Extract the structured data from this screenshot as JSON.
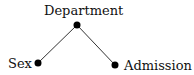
{
  "diagram": {
    "nodes": [
      {
        "id": "department",
        "label": "Department",
        "x": 77,
        "y": 25
      },
      {
        "id": "sex",
        "label": "Sex",
        "x": 38,
        "y": 63
      },
      {
        "id": "admission",
        "label": "Admission",
        "x": 115,
        "y": 65
      }
    ],
    "edges": [
      {
        "from": "department",
        "to": "sex"
      },
      {
        "from": "department",
        "to": "admission"
      }
    ],
    "colors": {
      "node": "#000000",
      "edge": "#333333",
      "text": "#111111"
    }
  }
}
